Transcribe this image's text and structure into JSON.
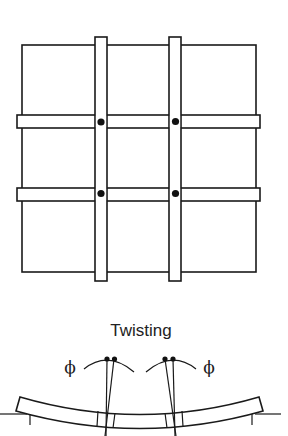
{
  "figure": {
    "panels": [
      {
        "id": "plan-view",
        "description": "Grid of slab panels with two vertical and two horizontal strips crossing; dots at the four interior intersections",
        "columns": 3,
        "rows": 3,
        "intersection_markers": 4
      },
      {
        "id": "twisting-section",
        "title": "Twisting",
        "angle_labels": [
          "ϕ",
          "ϕ"
        ]
      }
    ],
    "colors": {
      "stroke": "#1a1a1a",
      "background": "#ffffff"
    }
  }
}
